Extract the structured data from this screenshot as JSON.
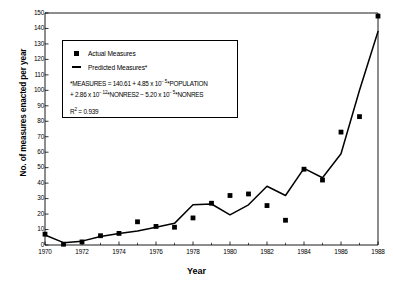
{
  "chart_data": {
    "type": "line",
    "title": "",
    "xlabel": "Year",
    "ylabel": "No. of measures enacted per year",
    "xlim": [
      1970,
      1988
    ],
    "ylim": [
      0,
      150
    ],
    "ytick_step": 10,
    "yticks": [
      0,
      10,
      20,
      30,
      40,
      50,
      60,
      70,
      80,
      90,
      100,
      110,
      120,
      130,
      140,
      150
    ],
    "xticks_major": [
      1970,
      1972,
      1974,
      1976,
      1978,
      1980,
      1982,
      1984,
      1986,
      1988
    ],
    "xticks_minor": [
      1971,
      1973,
      1975,
      1977,
      1979,
      1981,
      1983,
      1985,
      1987
    ],
    "grid": false,
    "legend_position": "upper-left-inset",
    "x": [
      1970,
      1971,
      1972,
      1973,
      1974,
      1975,
      1976,
      1977,
      1978,
      1979,
      1980,
      1981,
      1982,
      1983,
      1984,
      1985,
      1986,
      1987,
      1988
    ],
    "series": [
      {
        "name": "Actual Measures",
        "marker": "filled-square",
        "values": [
          7,
          0.5,
          2,
          6,
          7.5,
          15,
          12,
          11.5,
          17.5,
          27,
          32,
          33,
          25.5,
          16,
          49,
          42,
          73,
          83,
          148
        ]
      },
      {
        "name": "Predicted Measures*",
        "marker": "line",
        "values": [
          6.5,
          1.5,
          2.5,
          5.5,
          7.5,
          9,
          11.5,
          14,
          26,
          26.5,
          19.5,
          26,
          38,
          32,
          49.5,
          43.5,
          59,
          100,
          138
        ]
      }
    ]
  },
  "legend": {
    "entries": [
      {
        "label": "Actual Measures",
        "marker": "square"
      },
      {
        "label": "Predicted Measures*",
        "marker": "line"
      }
    ],
    "equation_line1_pre": "*MEASURES = 140.61 + 4.85 x 10",
    "equation_line1_exp": "− 5",
    "equation_line1_post": "*POPULATION",
    "equation_line2_pre": "+ 2.86 x 10",
    "equation_line2_exp": "− 12",
    "equation_line2_mid": "*NONRES2 − 5.20 x 10",
    "equation_line2_exp2": "− 5",
    "equation_line2_post": "*NONRES",
    "r_squared_label": "R",
    "r_squared_sup": "2",
    "r_squared_value": " = 0.939"
  },
  "axes": {
    "ylabel": "No. of measures enacted per year",
    "xlabel": "Year"
  }
}
